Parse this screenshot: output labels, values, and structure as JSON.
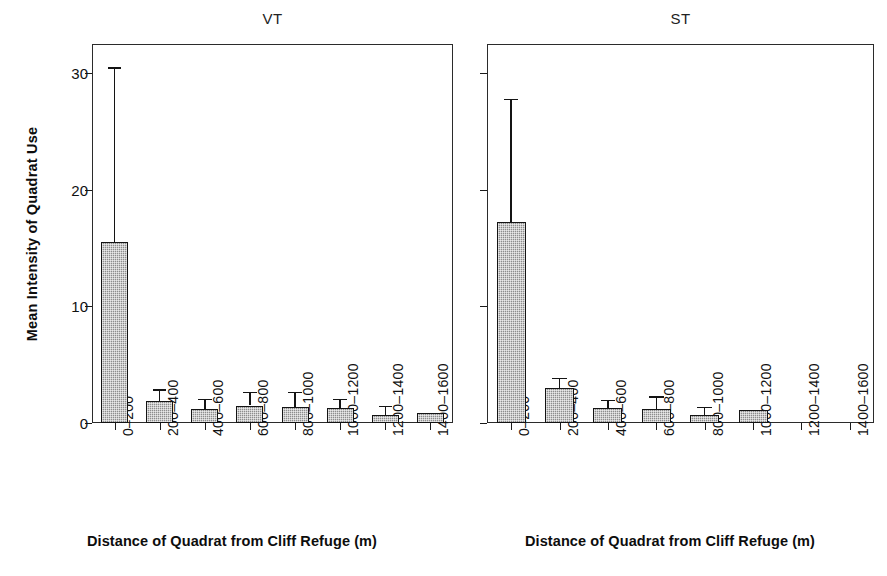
{
  "figure": {
    "width": 887,
    "height": 576,
    "background": "#ffffff",
    "bar_fill_color": "#8d8d8d",
    "bar_edge_color": "#141414",
    "axis_color": "#2b2b2b"
  },
  "axis_titles": {
    "y": "Mean Intensity of Quadrat Use",
    "x_left": "Distance of Quadrat from Cliff Refuge (m)",
    "x_right": "Distance of Quadrat from Cliff Refuge (m)"
  },
  "panels": [
    {
      "key": "vt",
      "title": "VT"
    },
    {
      "key": "st",
      "title": "ST"
    }
  ],
  "y_ticks": [
    "0",
    "10",
    "20",
    "30"
  ],
  "x_tick_labels": [
    "0–200",
    "200–400",
    "400–600",
    "600–800",
    "800–1000",
    "1000–1200",
    "1200–1400",
    "1400–1600"
  ],
  "chart_data": {
    "type": "bar",
    "title": "",
    "xlabel": "Distance of Quadrat from Cliff Refuge (m)",
    "ylabel": "Mean Intensity of Quadrat Use",
    "ylim": [
      0,
      32.5
    ],
    "y_ticks": [
      0,
      10,
      20,
      30
    ],
    "grid": false,
    "legend": "none",
    "error_bars": "upper only (mean + SE)",
    "categories": [
      "0-200",
      "200-400",
      "400-600",
      "600-800",
      "800-1000",
      "1000-1200",
      "1200-1400",
      "1400-1600"
    ],
    "panels": [
      {
        "name": "VT",
        "values": [
          15.5,
          1.9,
          1.2,
          1.5,
          1.4,
          1.3,
          0.7,
          0.9
        ],
        "error_upper": [
          30.5,
          2.9,
          2.1,
          2.7,
          2.7,
          2.1,
          1.5,
          null
        ]
      },
      {
        "name": "ST",
        "values": [
          17.2,
          3.0,
          1.3,
          1.2,
          0.7,
          1.1,
          0,
          0
        ],
        "error_upper": [
          27.8,
          3.9,
          2.0,
          2.3,
          1.4,
          null,
          null,
          null
        ]
      }
    ]
  }
}
